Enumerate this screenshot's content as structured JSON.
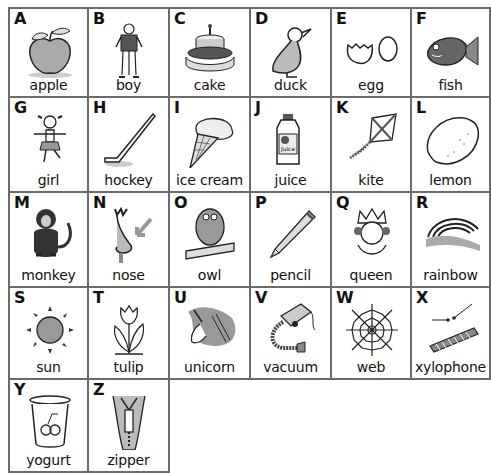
{
  "cards": [
    {
      "letter": "A",
      "word": "apple",
      "icon": "apple-icon"
    },
    {
      "letter": "B",
      "word": "boy",
      "icon": "boy-icon"
    },
    {
      "letter": "C",
      "word": "cake",
      "icon": "cake-icon"
    },
    {
      "letter": "D",
      "word": "duck",
      "icon": "duck-icon"
    },
    {
      "letter": "E",
      "word": "egg",
      "icon": "egg-icon"
    },
    {
      "letter": "F",
      "word": "fish",
      "icon": "fish-icon"
    },
    {
      "letter": "G",
      "word": "girl",
      "icon": "girl-icon"
    },
    {
      "letter": "H",
      "word": "hockey",
      "icon": "hockey-stick-icon"
    },
    {
      "letter": "I",
      "word": "ice cream",
      "icon": "ice-cream-icon"
    },
    {
      "letter": "J",
      "word": "juice",
      "icon": "juice-icon"
    },
    {
      "letter": "K",
      "word": "kite",
      "icon": "kite-icon"
    },
    {
      "letter": "L",
      "word": "lemon",
      "icon": "lemon-icon"
    },
    {
      "letter": "M",
      "word": "monkey",
      "icon": "monkey-icon"
    },
    {
      "letter": "N",
      "word": "nose",
      "icon": "nose-icon"
    },
    {
      "letter": "O",
      "word": "owl",
      "icon": "owl-icon"
    },
    {
      "letter": "P",
      "word": "pencil",
      "icon": "pencil-icon"
    },
    {
      "letter": "Q",
      "word": "queen",
      "icon": "queen-icon"
    },
    {
      "letter": "R",
      "word": "rainbow",
      "icon": "rainbow-icon"
    },
    {
      "letter": "S",
      "word": "sun",
      "icon": "sun-icon"
    },
    {
      "letter": "T",
      "word": "tulip",
      "icon": "tulip-icon"
    },
    {
      "letter": "U",
      "word": "unicorn",
      "icon": "unicorn-icon"
    },
    {
      "letter": "V",
      "word": "vacuum",
      "icon": "vacuum-icon"
    },
    {
      "letter": "W",
      "word": "web",
      "icon": "web-icon"
    },
    {
      "letter": "X",
      "word": "xylophone",
      "icon": "xylophone-icon"
    },
    {
      "letter": "Y",
      "word": "yogurt",
      "icon": "yogurt-icon"
    },
    {
      "letter": "Z",
      "word": "zipper",
      "icon": "zipper-icon"
    }
  ],
  "colors": {
    "line": "#6b6b6b",
    "ink": "#111111",
    "shade": "#9a9a9a"
  }
}
